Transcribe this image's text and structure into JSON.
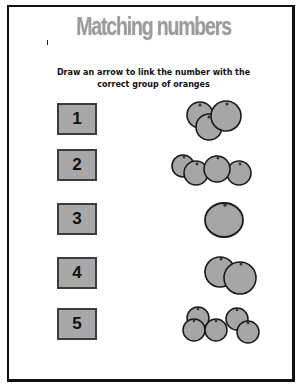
{
  "worksheet": {
    "title": "Matching numbers",
    "instructions": {
      "line1": "Draw an arrow to link the number with the",
      "line2": "correct group of oranges"
    },
    "numbers": [
      "1",
      "2",
      "3",
      "4",
      "5"
    ],
    "orange_groups": [
      {
        "row": 1,
        "count": 3
      },
      {
        "row": 2,
        "count": 4
      },
      {
        "row": 3,
        "count": 1
      },
      {
        "row": 4,
        "count": 2
      },
      {
        "row": 5,
        "count": 5
      }
    ],
    "colors": {
      "box_fill": "#a8a8a8",
      "orange_fill": "#a6a6a6",
      "outline": "#1a1a1a",
      "title_gradient_top": "#ececec",
      "title_gradient_bottom": "#a9a9a9"
    }
  }
}
